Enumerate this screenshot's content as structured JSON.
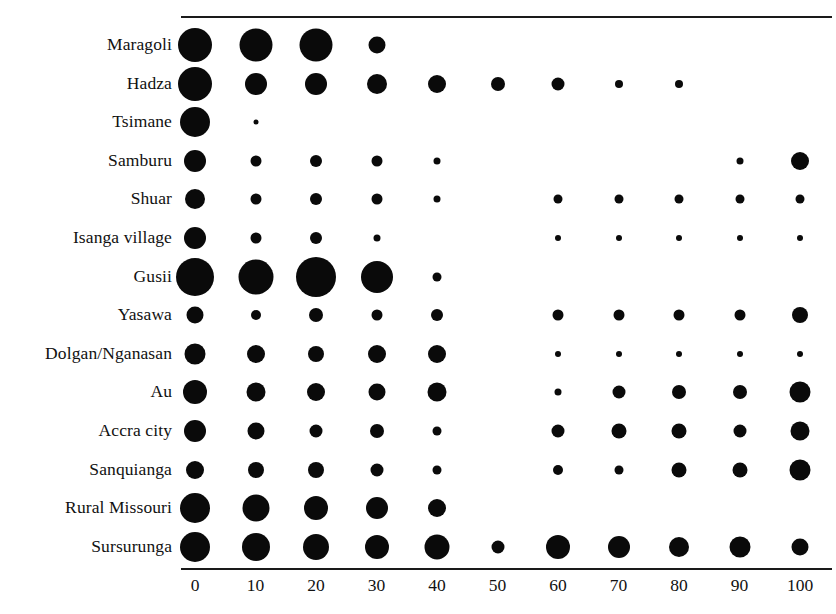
{
  "chart_data": {
    "type": "scatter",
    "title": "",
    "subtitle": "",
    "xlabel": "",
    "ylabel": "",
    "xlim": [
      -5,
      105
    ],
    "x_ticks": [
      0,
      10,
      20,
      30,
      40,
      50,
      60,
      70,
      80,
      90,
      100
    ],
    "x_tick_labels": [
      "0",
      "10",
      "20",
      "30",
      "40",
      "50",
      "60",
      "70",
      "80",
      "90",
      "100"
    ],
    "grid": false,
    "legend": "none",
    "marker_color": "#0a0a0a",
    "axis_color": "#1a1a1a",
    "categories": [
      "Maragoli",
      "Hadza",
      "Tsimane",
      "Samburu",
      "Shuar",
      "Isanga village",
      "Gusii",
      "Yasawa",
      "Dolgan/Nganasan",
      "Au",
      "Accra city",
      "Sanquianga",
      "Rural Missouri",
      "Sursurunga"
    ],
    "note": "Bubble area encodes frequency; value = marker diameter in px as rendered.",
    "rows": [
      {
        "label": "Maragoli",
        "points": [
          {
            "x": 0,
            "size": 34
          },
          {
            "x": 10,
            "size": 33
          },
          {
            "x": 20,
            "size": 33
          },
          {
            "x": 30,
            "size": 17
          }
        ]
      },
      {
        "label": "Hadza",
        "points": [
          {
            "x": 0,
            "size": 34
          },
          {
            "x": 10,
            "size": 22
          },
          {
            "x": 20,
            "size": 22
          },
          {
            "x": 30,
            "size": 20
          },
          {
            "x": 40,
            "size": 18
          },
          {
            "x": 50,
            "size": 14
          },
          {
            "x": 60,
            "size": 13
          },
          {
            "x": 70,
            "size": 8
          },
          {
            "x": 80,
            "size": 8
          }
        ]
      },
      {
        "label": "Tsimane",
        "points": [
          {
            "x": 0,
            "size": 30
          },
          {
            "x": 10,
            "size": 5
          }
        ]
      },
      {
        "label": "Samburu",
        "points": [
          {
            "x": 0,
            "size": 22
          },
          {
            "x": 10,
            "size": 11
          },
          {
            "x": 20,
            "size": 12
          },
          {
            "x": 30,
            "size": 11
          },
          {
            "x": 40,
            "size": 7
          },
          {
            "x": 90,
            "size": 7
          },
          {
            "x": 100,
            "size": 18
          }
        ]
      },
      {
        "label": "Shuar",
        "points": [
          {
            "x": 0,
            "size": 20
          },
          {
            "x": 10,
            "size": 11
          },
          {
            "x": 20,
            "size": 12
          },
          {
            "x": 30,
            "size": 11
          },
          {
            "x": 40,
            "size": 7
          },
          {
            "x": 60,
            "size": 9
          },
          {
            "x": 70,
            "size": 9
          },
          {
            "x": 80,
            "size": 9
          },
          {
            "x": 90,
            "size": 9
          },
          {
            "x": 100,
            "size": 9
          }
        ]
      },
      {
        "label": "Isanga village",
        "points": [
          {
            "x": 0,
            "size": 22
          },
          {
            "x": 10,
            "size": 11
          },
          {
            "x": 20,
            "size": 12
          },
          {
            "x": 30,
            "size": 7
          },
          {
            "x": 60,
            "size": 6
          },
          {
            "x": 70,
            "size": 6
          },
          {
            "x": 80,
            "size": 6
          },
          {
            "x": 90,
            "size": 6
          },
          {
            "x": 100,
            "size": 6
          }
        ]
      },
      {
        "label": "Gusii",
        "points": [
          {
            "x": 0,
            "size": 38
          },
          {
            "x": 10,
            "size": 35
          },
          {
            "x": 20,
            "size": 40
          },
          {
            "x": 30,
            "size": 32
          },
          {
            "x": 40,
            "size": 9
          }
        ]
      },
      {
        "label": "Yasawa",
        "points": [
          {
            "x": 0,
            "size": 17
          },
          {
            "x": 10,
            "size": 10
          },
          {
            "x": 20,
            "size": 14
          },
          {
            "x": 30,
            "size": 11
          },
          {
            "x": 40,
            "size": 12
          },
          {
            "x": 60,
            "size": 11
          },
          {
            "x": 70,
            "size": 11
          },
          {
            "x": 80,
            "size": 11
          },
          {
            "x": 90,
            "size": 11
          },
          {
            "x": 100,
            "size": 16
          }
        ]
      },
      {
        "label": "Dolgan/Nganasan",
        "points": [
          {
            "x": 0,
            "size": 21
          },
          {
            "x": 10,
            "size": 18
          },
          {
            "x": 20,
            "size": 16
          },
          {
            "x": 30,
            "size": 18
          },
          {
            "x": 40,
            "size": 18
          },
          {
            "x": 60,
            "size": 6
          },
          {
            "x": 70,
            "size": 6
          },
          {
            "x": 80,
            "size": 6
          },
          {
            "x": 90,
            "size": 6
          },
          {
            "x": 100,
            "size": 6
          }
        ]
      },
      {
        "label": "Au",
        "points": [
          {
            "x": 0,
            "size": 24
          },
          {
            "x": 10,
            "size": 19
          },
          {
            "x": 20,
            "size": 18
          },
          {
            "x": 30,
            "size": 17
          },
          {
            "x": 40,
            "size": 19
          },
          {
            "x": 60,
            "size": 7
          },
          {
            "x": 70,
            "size": 13
          },
          {
            "x": 80,
            "size": 14
          },
          {
            "x": 90,
            "size": 14
          },
          {
            "x": 100,
            "size": 21
          }
        ]
      },
      {
        "label": "Accra city",
        "points": [
          {
            "x": 0,
            "size": 22
          },
          {
            "x": 10,
            "size": 17
          },
          {
            "x": 20,
            "size": 13
          },
          {
            "x": 30,
            "size": 14
          },
          {
            "x": 40,
            "size": 9
          },
          {
            "x": 60,
            "size": 13
          },
          {
            "x": 70,
            "size": 15
          },
          {
            "x": 80,
            "size": 15
          },
          {
            "x": 90,
            "size": 13
          },
          {
            "x": 100,
            "size": 19
          }
        ]
      },
      {
        "label": "Sanquianga",
        "points": [
          {
            "x": 0,
            "size": 18
          },
          {
            "x": 10,
            "size": 16
          },
          {
            "x": 20,
            "size": 16
          },
          {
            "x": 30,
            "size": 13
          },
          {
            "x": 40,
            "size": 9
          },
          {
            "x": 60,
            "size": 10
          },
          {
            "x": 70,
            "size": 9
          },
          {
            "x": 80,
            "size": 15
          },
          {
            "x": 90,
            "size": 15
          },
          {
            "x": 100,
            "size": 21
          }
        ]
      },
      {
        "label": "Rural Missouri",
        "points": [
          {
            "x": 0,
            "size": 30
          },
          {
            "x": 10,
            "size": 27
          },
          {
            "x": 20,
            "size": 24
          },
          {
            "x": 30,
            "size": 22
          },
          {
            "x": 40,
            "size": 18
          }
        ]
      },
      {
        "label": "Sursurunga",
        "points": [
          {
            "x": 0,
            "size": 30
          },
          {
            "x": 10,
            "size": 28
          },
          {
            "x": 20,
            "size": 26
          },
          {
            "x": 30,
            "size": 24
          },
          {
            "x": 40,
            "size": 25
          },
          {
            "x": 50,
            "size": 13
          },
          {
            "x": 60,
            "size": 24
          },
          {
            "x": 70,
            "size": 22
          },
          {
            "x": 80,
            "size": 20
          },
          {
            "x": 90,
            "size": 21
          },
          {
            "x": 100,
            "size": 17
          }
        ]
      }
    ]
  },
  "layout": {
    "x_origin_px": 195,
    "x_step_px": 60.5,
    "row_first_y_px": 45,
    "row_step_px": 38.6
  }
}
